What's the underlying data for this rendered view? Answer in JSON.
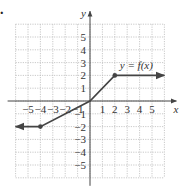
{
  "marker": ".",
  "chart_data": {
    "type": "line",
    "title": "",
    "xlabel": "x",
    "ylabel": "y",
    "function_label": "y = f(x)",
    "xlim": [
      -6,
      6
    ],
    "ylim": [
      -6,
      6
    ],
    "grid": true,
    "x_ticks": [
      -5,
      -4,
      -3,
      -2,
      -1,
      1,
      2,
      3,
      4,
      5
    ],
    "y_ticks": [
      5,
      4,
      3,
      2,
      1,
      -1,
      -2,
      -3,
      -4,
      -5
    ],
    "x_tick_labels": [
      "−5",
      "−4",
      "−3",
      "−2",
      "−1",
      "1",
      "2",
      "3",
      "4",
      "5"
    ],
    "y_tick_labels": [
      "5",
      "4",
      "3",
      "2",
      "1",
      "−1",
      "−2",
      "−3",
      "−4",
      "−5"
    ],
    "series": [
      {
        "name": "y = f(x)",
        "points": [
          [
            -6,
            -2
          ],
          [
            -4,
            -2
          ],
          [
            0,
            0
          ],
          [
            2,
            2
          ],
          [
            6,
            2
          ]
        ],
        "closed_points": [
          [
            -4,
            -2
          ],
          [
            2,
            2
          ]
        ],
        "left_arrow": true,
        "right_arrow": true
      }
    ]
  }
}
